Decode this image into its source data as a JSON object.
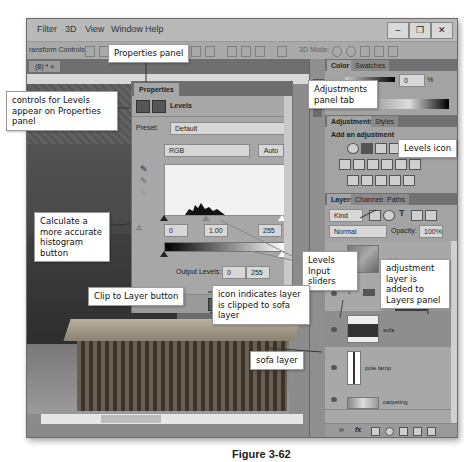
{
  "menu": {
    "items": [
      "Filter",
      "3D",
      "View",
      "Window",
      "Help"
    ],
    "window_controls": [
      "–",
      "❐",
      "✕"
    ]
  },
  "options_bar": {
    "transform_label": "ransform Controls",
    "mode_3d_label": "3D Mode:"
  },
  "document": {
    "tab_label": "(8) * ×"
  },
  "properties_panel": {
    "tab": "Properties",
    "title": "Levels",
    "preset_label": "Preset:",
    "preset_value": "Default",
    "channel_value": "RGB",
    "auto_button": "Auto",
    "input_black": "0",
    "input_gamma": "1.00",
    "input_white": "255",
    "output_label": "Output Levels:",
    "output_black": "0",
    "output_white": "255"
  },
  "color_panel": {
    "tabs": [
      "Color",
      "Swatches"
    ],
    "value": "0",
    "unit": "%"
  },
  "adjustments_panel": {
    "tabs": [
      "Adjustments",
      "Styles"
    ],
    "heading": "Add an adjustment"
  },
  "layers_panel": {
    "tabs": [
      "Layers",
      "Channels",
      "Paths"
    ],
    "filter_kind": "Kind",
    "blend_mode": "Normal",
    "opacity_label": "Opacity:",
    "opacity_value": "100%",
    "layers": [
      {
        "name": "painting"
      },
      {
        "name": ""
      },
      {
        "name": "sofa"
      },
      {
        "name": "pole lamp"
      },
      {
        "name": "carpeting"
      }
    ]
  },
  "callouts": {
    "properties_panel": "Properties panel",
    "controls_for_levels": "controls for Levels appear on Properties panel",
    "adjustments_tab": "Adjustments panel tab",
    "levels_icon": "Levels icon",
    "calculate_histogram": "Calculate a more accurate histogram button",
    "levels_sliders": "Levels Input sliders",
    "adjustment_layer_added": "adjustment layer is added to Layers panel",
    "clip_to_layer": "Clip to Layer button",
    "clipped_icon": "icon indicates layer is clipped to sofa layer",
    "sofa_layer": "sofa layer"
  },
  "caption": "Figure 3-62"
}
